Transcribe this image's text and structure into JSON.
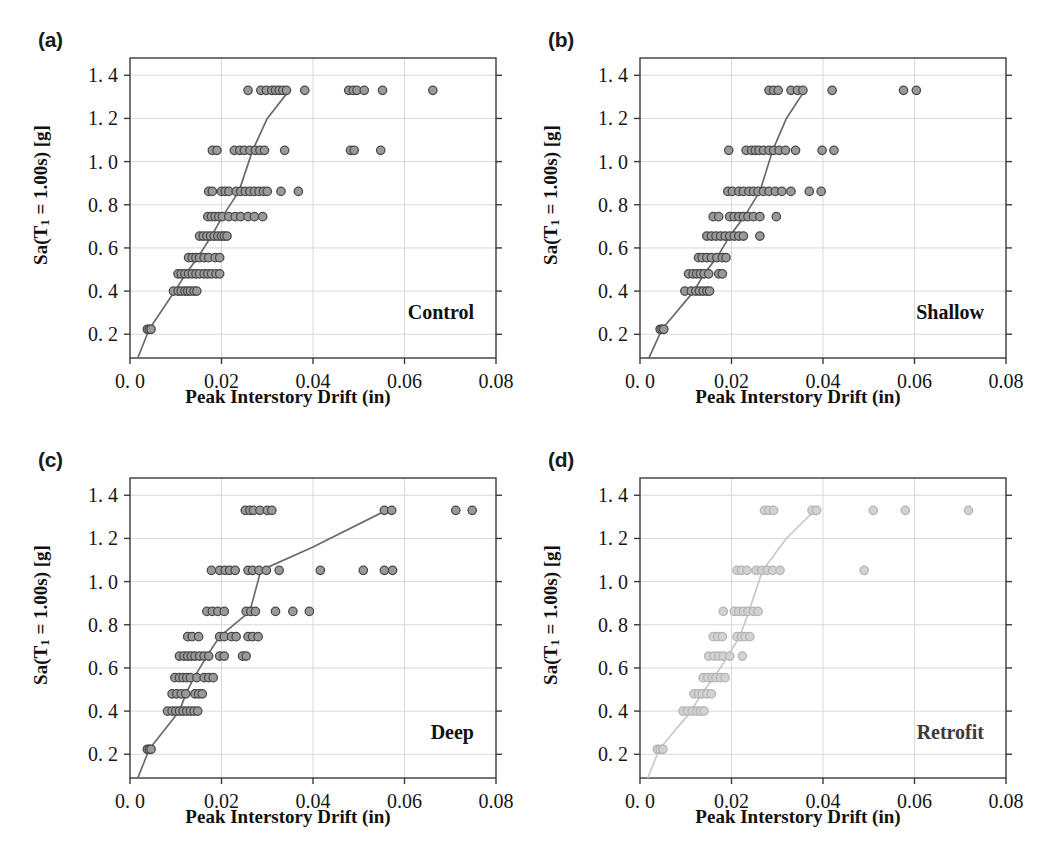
{
  "figure": {
    "title": "",
    "panel_count": 4
  },
  "axes": {
    "xlabel": "Peak Interstory Drift (in)",
    "ylabel_prefix": "Sa(T",
    "ylabel_sub": "1",
    "ylabel_suffix": " = 1.00s) [g]",
    "ylabel_plain": "Sa(T1 = 1.00s) [g]",
    "xticks": [
      0.0,
      0.02,
      0.04,
      0.06,
      0.08
    ],
    "xtick_labels": [
      "0. 0",
      "0.02",
      "0.04",
      "0.06",
      "0.08"
    ],
    "yticks": [
      0.2,
      0.4,
      0.6,
      0.8,
      1.0,
      1.2,
      1.4
    ],
    "ytick_labels": [
      "0. 2",
      "0. 4",
      "0. 6",
      "0. 8",
      "1. 0",
      "1. 2",
      "1. 4"
    ],
    "xlim": [
      0.0,
      0.08
    ],
    "ylim": [
      0.09,
      1.48
    ],
    "grid": true
  },
  "style": {
    "marker_fill": "#9a9a9a",
    "marker_edge": "#4a4a4a",
    "marker_radius": 4.2,
    "line_color": "#6b6b6b",
    "frame_color": "#3b3b3b",
    "grid_color": "#d8d8d8",
    "faded_marker_fill": "#d2d2d2",
    "faded_marker_edge": "#b4b4b4",
    "faded_line_color": "#c9c9c9"
  },
  "chart_data": [
    {
      "type": "scatter",
      "panel": "a",
      "panel_tag": "(a)",
      "case_label": "Control",
      "faded": false,
      "title": "",
      "xlabel": "Peak Interstory Drift (in)",
      "ylabel": "Sa(T1 = 1.00s) [g]",
      "xlim": [
        0.0,
        0.08
      ],
      "ylim": [
        0.09,
        1.48
      ],
      "median_curve": {
        "name": "Median IDA curve",
        "x": [
          0.0,
          0.0042,
          0.0098,
          0.0122,
          0.0148,
          0.0178,
          0.0202,
          0.0238,
          0.0268,
          0.03,
          0.0348
        ],
        "y": [
          0.0,
          0.223,
          0.4,
          0.48,
          0.555,
          0.655,
          0.745,
          0.862,
          1.052,
          1.2,
          1.33
        ]
      },
      "points": {
        "x": [
          0.0038,
          0.0042,
          0.0046,
          0.0095,
          0.0105,
          0.0112,
          0.012,
          0.0126,
          0.0132,
          0.014,
          0.0146,
          0.0105,
          0.0112,
          0.012,
          0.0128,
          0.0136,
          0.0144,
          0.0152,
          0.0162,
          0.017,
          0.0178,
          0.0188,
          0.0196,
          0.0128,
          0.0136,
          0.0144,
          0.0152,
          0.0162,
          0.0172,
          0.0186,
          0.0196,
          0.0152,
          0.016,
          0.0168,
          0.0176,
          0.0184,
          0.0192,
          0.02,
          0.0206,
          0.0212,
          0.017,
          0.0178,
          0.0186,
          0.0194,
          0.0202,
          0.0216,
          0.023,
          0.0242,
          0.0258,
          0.0272,
          0.029,
          0.0172,
          0.018,
          0.02,
          0.0208,
          0.0216,
          0.0232,
          0.0242,
          0.0252,
          0.0262,
          0.0272,
          0.0282,
          0.0292,
          0.03,
          0.033,
          0.0368,
          0.018,
          0.019,
          0.0228,
          0.024,
          0.025,
          0.0262,
          0.0274,
          0.0284,
          0.0294,
          0.0338,
          0.0482,
          0.049,
          0.0548,
          0.0258,
          0.0286,
          0.0298,
          0.031,
          0.0318,
          0.0326,
          0.0334,
          0.0342,
          0.0382,
          0.0478,
          0.0488,
          0.0496,
          0.0512,
          0.0552,
          0.0662
        ],
        "y": [
          0.223,
          0.223,
          0.223,
          0.4,
          0.4,
          0.4,
          0.4,
          0.4,
          0.4,
          0.4,
          0.4,
          0.48,
          0.48,
          0.48,
          0.48,
          0.48,
          0.48,
          0.48,
          0.48,
          0.48,
          0.48,
          0.48,
          0.48,
          0.555,
          0.555,
          0.555,
          0.555,
          0.555,
          0.555,
          0.555,
          0.555,
          0.655,
          0.655,
          0.655,
          0.655,
          0.655,
          0.655,
          0.655,
          0.655,
          0.655,
          0.745,
          0.745,
          0.745,
          0.745,
          0.745,
          0.745,
          0.745,
          0.745,
          0.745,
          0.745,
          0.745,
          0.862,
          0.862,
          0.862,
          0.862,
          0.862,
          0.862,
          0.862,
          0.862,
          0.862,
          0.862,
          0.862,
          0.862,
          0.862,
          0.862,
          0.862,
          1.052,
          1.052,
          1.052,
          1.052,
          1.052,
          1.052,
          1.052,
          1.052,
          1.052,
          1.052,
          1.052,
          1.052,
          1.052,
          1.33,
          1.33,
          1.33,
          1.33,
          1.33,
          1.33,
          1.33,
          1.33,
          1.33,
          1.33,
          1.33,
          1.33,
          1.33,
          1.33,
          1.33
        ]
      }
    },
    {
      "type": "scatter",
      "panel": "b",
      "panel_tag": "(b)",
      "case_label": "Shallow",
      "faded": false,
      "title": "",
      "xlabel": "Peak Interstory Drift (in)",
      "ylabel": "Sa(T1 = 1.00s) [g]",
      "xlim": [
        0.0,
        0.08
      ],
      "ylim": [
        0.09,
        1.48
      ],
      "median_curve": {
        "name": "Median IDA curve",
        "x": [
          0.0,
          0.0048,
          0.0118,
          0.014,
          0.0168,
          0.0196,
          0.0228,
          0.0262,
          0.029,
          0.032,
          0.036
        ],
        "y": [
          0.0,
          0.223,
          0.4,
          0.48,
          0.555,
          0.655,
          0.745,
          0.862,
          1.052,
          1.2,
          1.33
        ]
      },
      "points": {
        "x": [
          0.0044,
          0.0048,
          0.0052,
          0.0098,
          0.0112,
          0.0122,
          0.013,
          0.0138,
          0.0146,
          0.0152,
          0.0106,
          0.0116,
          0.0124,
          0.0132,
          0.014,
          0.015,
          0.0172,
          0.018,
          0.0128,
          0.0136,
          0.0146,
          0.0156,
          0.0168,
          0.018,
          0.0188,
          0.0146,
          0.0156,
          0.0166,
          0.0176,
          0.0186,
          0.0196,
          0.0206,
          0.0216,
          0.0226,
          0.0262,
          0.016,
          0.0172,
          0.0196,
          0.0206,
          0.0216,
          0.0226,
          0.0236,
          0.0248,
          0.0262,
          0.0298,
          0.0192,
          0.0202,
          0.0216,
          0.0226,
          0.0238,
          0.0248,
          0.0258,
          0.027,
          0.0282,
          0.0296,
          0.031,
          0.033,
          0.037,
          0.0396,
          0.0194,
          0.0232,
          0.0244,
          0.0252,
          0.026,
          0.027,
          0.0282,
          0.0292,
          0.0304,
          0.0318,
          0.034,
          0.0398,
          0.0424,
          0.0282,
          0.0292,
          0.0302,
          0.033,
          0.0344,
          0.0356,
          0.042,
          0.0576,
          0.0604
        ],
        "y": [
          0.223,
          0.223,
          0.223,
          0.4,
          0.4,
          0.4,
          0.4,
          0.4,
          0.4,
          0.4,
          0.48,
          0.48,
          0.48,
          0.48,
          0.48,
          0.48,
          0.48,
          0.48,
          0.555,
          0.555,
          0.555,
          0.555,
          0.555,
          0.555,
          0.555,
          0.655,
          0.655,
          0.655,
          0.655,
          0.655,
          0.655,
          0.655,
          0.655,
          0.655,
          0.655,
          0.745,
          0.745,
          0.745,
          0.745,
          0.745,
          0.745,
          0.745,
          0.745,
          0.745,
          0.745,
          0.862,
          0.862,
          0.862,
          0.862,
          0.862,
          0.862,
          0.862,
          0.862,
          0.862,
          0.862,
          0.862,
          0.862,
          0.862,
          0.862,
          1.052,
          1.052,
          1.052,
          1.052,
          1.052,
          1.052,
          1.052,
          1.052,
          1.052,
          1.052,
          1.052,
          1.052,
          1.052,
          1.33,
          1.33,
          1.33,
          1.33,
          1.33,
          1.33,
          1.33,
          1.33,
          1.33
        ]
      }
    },
    {
      "type": "scatter",
      "panel": "c",
      "panel_tag": "(c)",
      "case_label": "Deep",
      "faded": false,
      "title": "",
      "xlabel": "Peak Interstory Drift (in)",
      "ylabel": "Sa(T1 = 1.00s) [g]",
      "xlim": [
        0.0,
        0.08
      ],
      "ylim": [
        0.09,
        1.48
      ],
      "median_curve": {
        "name": "Median IDA curve",
        "x": [
          0.0,
          0.0042,
          0.0108,
          0.0122,
          0.014,
          0.0168,
          0.0196,
          0.0262,
          0.0286,
          0.04,
          0.056
        ],
        "y": [
          0.0,
          0.223,
          0.4,
          0.48,
          0.555,
          0.655,
          0.745,
          0.862,
          1.052,
          1.16,
          1.33
        ]
      },
      "points": {
        "x": [
          0.0038,
          0.0042,
          0.0046,
          0.0082,
          0.0092,
          0.01,
          0.0108,
          0.0116,
          0.0124,
          0.0132,
          0.014,
          0.0148,
          0.0092,
          0.0102,
          0.0112,
          0.0122,
          0.0142,
          0.015,
          0.0158,
          0.0098,
          0.0108,
          0.0116,
          0.0124,
          0.0132,
          0.0146,
          0.0162,
          0.0172,
          0.0182,
          0.0108,
          0.0118,
          0.0126,
          0.0134,
          0.0142,
          0.0152,
          0.0162,
          0.0172,
          0.0196,
          0.0206,
          0.0246,
          0.0254,
          0.0126,
          0.0136,
          0.015,
          0.0196,
          0.0206,
          0.0222,
          0.0232,
          0.0258,
          0.0268,
          0.028,
          0.0168,
          0.018,
          0.0192,
          0.0206,
          0.0254,
          0.0264,
          0.0274,
          0.0318,
          0.0356,
          0.0392,
          0.0178,
          0.0196,
          0.0208,
          0.0218,
          0.023,
          0.0258,
          0.0268,
          0.0282,
          0.0298,
          0.0326,
          0.0416,
          0.051,
          0.0556,
          0.0574,
          0.0252,
          0.0262,
          0.027,
          0.0284,
          0.03,
          0.031,
          0.0556,
          0.0572,
          0.0712,
          0.0748
        ],
        "y": [
          0.223,
          0.223,
          0.223,
          0.4,
          0.4,
          0.4,
          0.4,
          0.4,
          0.4,
          0.4,
          0.4,
          0.4,
          0.48,
          0.48,
          0.48,
          0.48,
          0.48,
          0.48,
          0.48,
          0.555,
          0.555,
          0.555,
          0.555,
          0.555,
          0.555,
          0.555,
          0.555,
          0.555,
          0.655,
          0.655,
          0.655,
          0.655,
          0.655,
          0.655,
          0.655,
          0.655,
          0.655,
          0.655,
          0.655,
          0.655,
          0.745,
          0.745,
          0.745,
          0.745,
          0.745,
          0.745,
          0.745,
          0.745,
          0.745,
          0.745,
          0.862,
          0.862,
          0.862,
          0.862,
          0.862,
          0.862,
          0.862,
          0.862,
          0.862,
          0.862,
          1.052,
          1.052,
          1.052,
          1.052,
          1.052,
          1.052,
          1.052,
          1.052,
          1.052,
          1.052,
          1.052,
          1.052,
          1.052,
          1.052,
          1.33,
          1.33,
          1.33,
          1.33,
          1.33,
          1.33,
          1.33,
          1.33,
          1.33,
          1.33
        ]
      }
    },
    {
      "type": "scatter",
      "panel": "d",
      "panel_tag": "(d)",
      "case_label": "Retrofit",
      "faded": true,
      "title": "",
      "xlabel": "Peak Interstory Drift (in)",
      "ylabel": "Sa(T1 = 1.00s) [g]",
      "xlim": [
        0.0,
        0.08
      ],
      "ylim": [
        0.09,
        1.48
      ],
      "median_curve": {
        "name": "Median IDA curve",
        "x": [
          0.0,
          0.0042,
          0.0112,
          0.0134,
          0.0162,
          0.0192,
          0.0218,
          0.0238,
          0.0268,
          0.032,
          0.0382
        ],
        "y": [
          0.0,
          0.223,
          0.4,
          0.48,
          0.555,
          0.655,
          0.745,
          0.862,
          1.052,
          1.2,
          1.33
        ]
      },
      "points": {
        "x": [
          0.0038,
          0.0044,
          0.005,
          0.0094,
          0.0104,
          0.0114,
          0.0124,
          0.0132,
          0.014,
          0.0118,
          0.0128,
          0.0136,
          0.0146,
          0.0156,
          0.0138,
          0.0148,
          0.0158,
          0.0166,
          0.0176,
          0.0186,
          0.015,
          0.0162,
          0.0172,
          0.0182,
          0.0196,
          0.0224,
          0.016,
          0.017,
          0.018,
          0.0212,
          0.0222,
          0.023,
          0.024,
          0.0182,
          0.0206,
          0.0216,
          0.0226,
          0.0236,
          0.0248,
          0.0258,
          0.0212,
          0.0222,
          0.0234,
          0.0254,
          0.0266,
          0.0278,
          0.029,
          0.0306,
          0.049,
          0.0272,
          0.0282,
          0.0292,
          0.0376,
          0.0386,
          0.051,
          0.058,
          0.0718
        ],
        "y": [
          0.223,
          0.223,
          0.223,
          0.4,
          0.4,
          0.4,
          0.4,
          0.4,
          0.4,
          0.48,
          0.48,
          0.48,
          0.48,
          0.48,
          0.555,
          0.555,
          0.555,
          0.555,
          0.555,
          0.555,
          0.655,
          0.655,
          0.655,
          0.655,
          0.655,
          0.655,
          0.745,
          0.745,
          0.745,
          0.745,
          0.745,
          0.745,
          0.745,
          0.862,
          0.862,
          0.862,
          0.862,
          0.862,
          0.862,
          0.862,
          1.052,
          1.052,
          1.052,
          1.052,
          1.052,
          1.052,
          1.052,
          1.052,
          1.052,
          1.33,
          1.33,
          1.33,
          1.33,
          1.33,
          1.33,
          1.33,
          1.33
        ]
      }
    }
  ]
}
